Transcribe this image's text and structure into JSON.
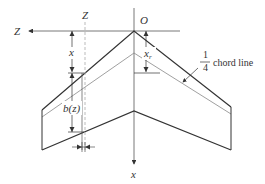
{
  "diagram": {
    "labels": {
      "z_axis": "Z",
      "z_station": "Z",
      "origin": "O",
      "x_axis": "x",
      "x_dim": "x",
      "xr_main": "x",
      "xr_sub": "r",
      "bz": "b(z)",
      "frac_num": "1",
      "frac_den": "4",
      "chord_line": "chord line"
    },
    "colors": {
      "edge": "#333333",
      "quarter_chord": "#888888",
      "axis": "#555555",
      "dashed": "#aaaaaa"
    }
  }
}
